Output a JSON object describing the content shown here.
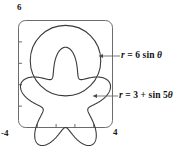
{
  "figure": {
    "type": "polar-graph",
    "stroke_color": "#3a3a3a",
    "frame_color": "#6b6b6b",
    "text_color": "#111111",
    "background": "#ffffff"
  },
  "axes": {
    "y_max_label": "6",
    "x_min_label": "-4",
    "x_max_label": "4",
    "x_range": [
      -4,
      4
    ],
    "y_range": [
      -2,
      6
    ],
    "x_tick_count": 4,
    "y_tick_count": 4,
    "grid": false
  },
  "annotations": {
    "circle": {
      "name": "r = 6 sin theta",
      "text_r": "r",
      "text_eq": " = 6 sin ",
      "text_theta": "θ"
    },
    "rose": {
      "name": "r = 3 + sin 5theta",
      "text_r": "r",
      "text_eq": " = 3 + sin 5",
      "text_theta": "θ"
    }
  },
  "chart_data": {
    "type": "line",
    "title": "",
    "xlabel": "",
    "ylabel": "",
    "xlim": [
      -4,
      4
    ],
    "ylim": [
      -2,
      6
    ],
    "grid": false,
    "legend": "inline-callouts",
    "series": [
      {
        "name": "r = 6 sin θ",
        "equation": "r = 6*sin(theta)",
        "shape": "circle",
        "center_cartesian": [
          0,
          3
        ],
        "radius": 3,
        "theta_range_deg": [
          0,
          180
        ],
        "callout_text": "r = 6 sin θ"
      },
      {
        "name": "r = 3 + sin 5θ",
        "equation": "r = 3 + sin(5*theta)",
        "shape": "five-petal-limacon",
        "r_min": 2,
        "r_max": 4,
        "petals": 5,
        "theta_range_deg": [
          0,
          360
        ],
        "callout_text": "r = 3 + sin 5θ"
      }
    ]
  }
}
